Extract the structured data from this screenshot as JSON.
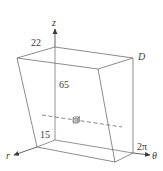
{
  "figure": {
    "region_label": "D",
    "axes": {
      "z": "z",
      "r": "r",
      "theta": "θ"
    },
    "dimension_labels": {
      "top_r": "22",
      "height": "65",
      "bottom_r": "15",
      "theta_max": "2π"
    },
    "colors": {
      "edge": "#6f6f6f",
      "axis": "#3a3a3a",
      "dashed": "#555555",
      "cube_fill": "#bdbdbd"
    }
  }
}
